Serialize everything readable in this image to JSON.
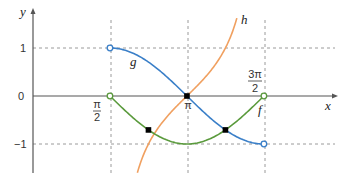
{
  "chart_data": {
    "type": "line",
    "title": "",
    "xlabel": "x",
    "ylabel": "y",
    "xlim": [
      0,
      6.1
    ],
    "ylim": [
      -1.6,
      1.8
    ],
    "grid": "dashed at x = π/2, π, 3π/2 and y = 1, −1",
    "x_ticks": [
      {
        "value": 1.5708,
        "label_num": "π",
        "label_den": "2"
      },
      {
        "value": 3.1416,
        "label": "π"
      },
      {
        "value": 4.7124,
        "label_num": "3π",
        "label_den": "2"
      }
    ],
    "y_ticks": [
      {
        "value": 1,
        "label": "1"
      },
      {
        "value": 0,
        "label": "0"
      },
      {
        "value": -1,
        "label": "−1"
      }
    ],
    "series": [
      {
        "name": "f",
        "color": "#5a9a3c",
        "function": "cos x",
        "domain": [
          1.5708,
          4.7124
        ],
        "endpoints": "open circles at (π/2, 0) and (3π/2, 0)"
      },
      {
        "name": "g",
        "color": "#3a7fc8",
        "function": "sin x",
        "domain": [
          1.5708,
          4.7124
        ],
        "endpoints": "open circles at (π/2, 1) and (3π/2, −1)"
      },
      {
        "name": "h",
        "color": "#f0a060",
        "function": "tan x",
        "domain": [
          2.13,
          4.16
        ]
      }
    ],
    "marked_points": [
      {
        "x": 3.1416,
        "y": 0,
        "note": "g and h intersect at (π, 0)"
      },
      {
        "x": 2.356,
        "y": -0.707,
        "note": "f and h intersect"
      },
      {
        "x": 3.927,
        "y": -0.707,
        "note": "f and g intersect"
      }
    ]
  },
  "labels": {
    "x_axis": "x",
    "y_axis": "y",
    "f": "f",
    "g": "g",
    "h": "h",
    "y1": "1",
    "y0": "0",
    "ym1": "−1",
    "pi": "π",
    "pi_half_num": "π",
    "pi_half_den": "2",
    "three_pi_half_num": "3π",
    "three_pi_half_den": "2"
  },
  "colors": {
    "f": "#5a9a3c",
    "g": "#3a7fc8",
    "h": "#f0a060",
    "axis": "#555555",
    "grid": "#9a9a9a"
  }
}
